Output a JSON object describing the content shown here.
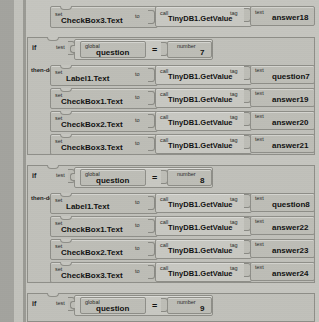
{
  "editor": {
    "name": "blocks-editor-canvas",
    "theme": {
      "canvas_bg": "#c9c9c4",
      "block_fill": "#bdbdb6",
      "block_stroke": "#8e8e88",
      "gutter": "#a3a39e"
    }
  },
  "keywords": {
    "set": "set",
    "to": "to",
    "call": "call",
    "tag": "tag",
    "text": "text",
    "if": "if",
    "test": "test",
    "then_do": "then-do",
    "global": "global",
    "number": "number",
    "equals": "="
  },
  "blocks": [
    {
      "id": "set-row-top",
      "kind": "set-statement",
      "target": "CheckBox3.Text",
      "call": "TinyDB1.GetValue",
      "tag_value": "answer18"
    },
    {
      "id": "if-block-7",
      "kind": "if-then",
      "condition": {
        "variable": "question",
        "operator": "=",
        "number": "7"
      },
      "body": [
        {
          "target": "Label1.Text",
          "call": "TinyDB1.GetValue",
          "tag_value": "question7"
        },
        {
          "target": "CheckBox1.Text",
          "call": "TinyDB1.GetValue",
          "tag_value": "answer19"
        },
        {
          "target": "CheckBox2.Text",
          "call": "TinyDB1.GetValue",
          "tag_value": "answer20"
        },
        {
          "target": "CheckBox3.Text",
          "call": "TinyDB1.GetValue",
          "tag_value": "answer21"
        }
      ]
    },
    {
      "id": "if-block-8",
      "kind": "if-then",
      "condition": {
        "variable": "question",
        "operator": "=",
        "number": "8"
      },
      "body": [
        {
          "target": "Label1.Text",
          "call": "TinyDB1.GetValue",
          "tag_value": "question8"
        },
        {
          "target": "CheckBox1.Text",
          "call": "TinyDB1.GetValue",
          "tag_value": "answer22"
        },
        {
          "target": "CheckBox2.Text",
          "call": "TinyDB1.GetValue",
          "tag_value": "answer23"
        },
        {
          "target": "CheckBox3.Text",
          "call": "TinyDB1.GetValue",
          "tag_value": "answer24"
        }
      ]
    },
    {
      "id": "if-block-9",
      "kind": "if-then",
      "condition": {
        "variable": "question",
        "operator": "=",
        "number": "9"
      },
      "body": []
    }
  ]
}
